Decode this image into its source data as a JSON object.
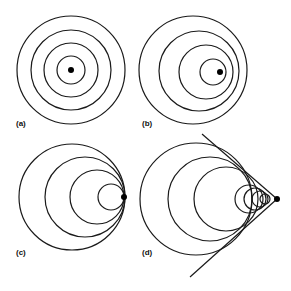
{
  "figure": {
    "stroke_color": "#1a1a1a",
    "panels": [
      {
        "label": "(a)",
        "label_pos": [
          16,
          127
        ],
        "source": [
          71,
          70
        ],
        "circles": [
          [
            71,
            70,
            14
          ],
          [
            71,
            70,
            27
          ],
          [
            71,
            70,
            40
          ],
          [
            71,
            70,
            54
          ]
        ]
      },
      {
        "label": "(b)",
        "label_pos": [
          142,
          127
        ],
        "source": [
          220,
          72
        ],
        "circles": [
          [
            213,
            72,
            13
          ],
          [
            206,
            72,
            27
          ],
          [
            199,
            71,
            40
          ],
          [
            193,
            70,
            54
          ]
        ]
      },
      {
        "label": "(c)",
        "label_pos": [
          16,
          256
        ],
        "source": [
          124,
          197
        ],
        "circles": [
          [
            111,
            197,
            13
          ],
          [
            97,
            197,
            27
          ],
          [
            85,
            197,
            40
          ],
          [
            72,
            197,
            53
          ]
        ]
      },
      {
        "label": "(d)",
        "label_pos": [
          142,
          256
        ],
        "source": [
          277,
          199
        ],
        "circles": [
          [
            196,
            199,
            56
          ],
          [
            210,
            199,
            42
          ],
          [
            226,
            199,
            32
          ],
          [
            249,
            199,
            14
          ],
          [
            255,
            199,
            11
          ],
          [
            260,
            199,
            8
          ],
          [
            265,
            199,
            5
          ]
        ],
        "lines": [
          [
            277,
            199,
            202,
            134
          ],
          [
            277,
            199,
            190,
            277
          ]
        ]
      }
    ]
  }
}
